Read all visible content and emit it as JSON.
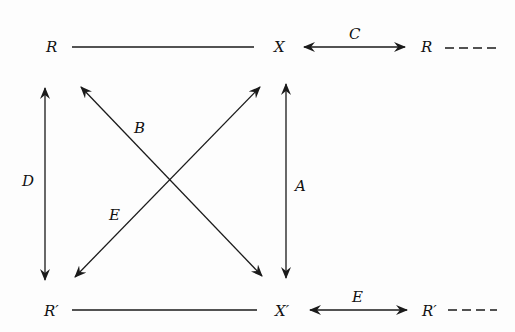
{
  "nodes": {
    "top_left": "R",
    "top_mid": "X",
    "top_right": "R",
    "bottom_left": "R′",
    "bottom_mid": "X′",
    "bottom_right": "R′"
  },
  "edges": {
    "top_c": "C",
    "bottom_e": "E",
    "left_d": "D",
    "right_a": "A",
    "diag_b": "B",
    "diag_e": "E"
  },
  "continuation": "- - -"
}
